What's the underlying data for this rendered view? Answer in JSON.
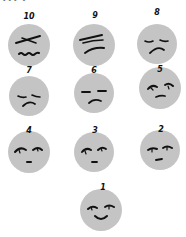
{
  "header": {
    "cropped_text": "••• •"
  },
  "colors": {
    "face_fill": "#c4c4c4",
    "stroke": "#111111",
    "background": "#ffffff"
  },
  "scale": {
    "description": "Faces pain rating scale, 10 (worst) to 1 (best)",
    "items": [
      {
        "label": "10",
        "expression": "severe-pain",
        "cx": 29,
        "cy": 45,
        "lx": 29,
        "ly": 13
      },
      {
        "label": "9",
        "expression": "very-strong-pain",
        "cx": 94,
        "cy": 45,
        "lx": 95,
        "ly": 12
      },
      {
        "label": "8",
        "expression": "strong-pain",
        "cx": 157,
        "cy": 44,
        "lx": 157,
        "ly": 9
      },
      {
        "label": "7",
        "expression": "considerable-pain",
        "cx": 29,
        "cy": 96,
        "lx": 29,
        "ly": 67
      },
      {
        "label": "6",
        "expression": "moderate-pain",
        "cx": 94,
        "cy": 93,
        "lx": 94,
        "ly": 67
      },
      {
        "label": "5",
        "expression": "medium-pain",
        "cx": 160,
        "cy": 88,
        "lx": 160,
        "ly": 66
      },
      {
        "label": "4",
        "expression": "mild-moderate-pain",
        "cx": 29,
        "cy": 152,
        "lx": 29,
        "ly": 127
      },
      {
        "label": "3",
        "expression": "mild-pain",
        "cx": 94,
        "cy": 152,
        "lx": 95,
        "ly": 127
      },
      {
        "label": "2",
        "expression": "slight-pain",
        "cx": 160,
        "cy": 150,
        "lx": 161,
        "ly": 126
      },
      {
        "label": "1",
        "expression": "no-pain-smile",
        "cx": 101,
        "cy": 210,
        "lx": 103,
        "ly": 184
      }
    ]
  }
}
